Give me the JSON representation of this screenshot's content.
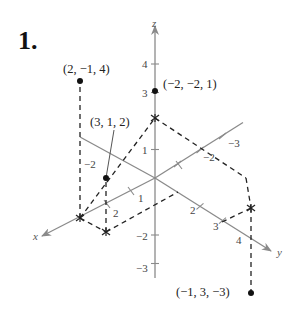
{
  "problem_number": "1.",
  "axes": {
    "x_label": "x",
    "y_label": "y",
    "z_label": "z",
    "z_ticks": [
      {
        "value": 4,
        "label": "4"
      },
      {
        "value": 3,
        "label": "3"
      },
      {
        "value": 1,
        "label": "1"
      },
      {
        "value": -2,
        "label": "−2"
      },
      {
        "value": -3,
        "label": "−3"
      }
    ],
    "x_ticks": [
      {
        "value": -2,
        "label": "−2"
      },
      {
        "value": 1,
        "label": "1"
      },
      {
        "value": 2,
        "label": "2"
      }
    ],
    "y_ticks": [
      {
        "value": -3,
        "label": "−3"
      },
      {
        "value": -2,
        "label": "−2"
      },
      {
        "value": 2,
        "label": "2"
      },
      {
        "value": 3,
        "label": "3"
      },
      {
        "value": 4,
        "label": "4"
      }
    ],
    "axis_color": "#8a8a8a"
  },
  "points": [
    {
      "coords": [
        2,
        -1,
        4
      ],
      "label": "(2, −1, 4)"
    },
    {
      "coords": [
        -2,
        -2,
        1
      ],
      "label": "(−2, −2, 1)"
    },
    {
      "coords": [
        3,
        1,
        2
      ],
      "label": "(3, 1, 2)"
    },
    {
      "coords": [
        -1,
        3,
        -3
      ],
      "label": "(−1, 3, −3)"
    }
  ]
}
